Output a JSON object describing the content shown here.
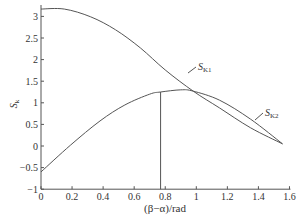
{
  "chart_data": {
    "type": "line",
    "title": "",
    "xlabel": "(β−α)/rad",
    "ylabel": "S_k",
    "xlim": [
      0,
      1.6
    ],
    "ylim": [
      -1,
      3.2
    ],
    "grid": false,
    "legend": "inline labels",
    "x_ticks": [
      "0",
      "0.2",
      "0.4",
      "0.6",
      "0.8",
      "1",
      "1.2",
      "1.4",
      "1.6"
    ],
    "y_ticks": [
      "-1",
      "-0.5",
      "0",
      "0.5",
      "1",
      "1.5",
      "2",
      "2.5",
      "3"
    ],
    "series": [
      {
        "name": "S_K1",
        "label_main": "S",
        "label_sub": "K1",
        "points": [
          [
            0,
            3.17
          ],
          [
            0.15,
            3.17
          ],
          [
            0.32,
            2.99
          ],
          [
            0.48,
            2.69
          ],
          [
            0.64,
            2.27
          ],
          [
            0.8,
            1.76
          ],
          [
            0.98,
            1.27
          ],
          [
            1.15,
            0.88
          ],
          [
            1.35,
            0.42
          ],
          [
            1.555,
            0.05
          ]
        ]
      },
      {
        "name": "S_K2",
        "label_main": "S",
        "label_sub": "K2",
        "points": [
          [
            0,
            -0.6
          ],
          [
            0.19,
            0.02
          ],
          [
            0.38,
            0.58
          ],
          [
            0.54,
            0.95
          ],
          [
            0.7,
            1.2
          ],
          [
            0.77,
            1.25
          ],
          [
            0.9,
            1.3
          ],
          [
            0.98,
            1.27
          ],
          [
            1.15,
            1.06
          ],
          [
            1.35,
            0.62
          ],
          [
            1.555,
            0.05
          ]
        ]
      }
    ],
    "annotations": [
      {
        "type": "vline",
        "x": 0.77,
        "y_from": -1,
        "y_to": 1.25
      }
    ]
  },
  "labels": {
    "ylabel_main": "S",
    "ylabel_sub": "k",
    "xlabel": "(β−α)/rad"
  }
}
